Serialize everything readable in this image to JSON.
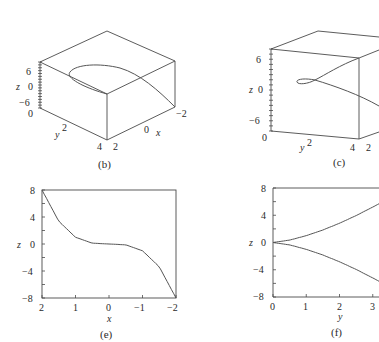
{
  "chart_data": [
    {
      "id": "b",
      "type": "line",
      "projection": "3d",
      "caption": "(b)",
      "title": "",
      "xlabel": "x",
      "ylabel": "y",
      "zlabel": "z",
      "x_ticks": [
        "2",
        "0",
        "−2"
      ],
      "y_ticks": [
        "0",
        "2",
        "4"
      ],
      "z_ticks": [
        "6",
        "0",
        "−6"
      ],
      "xlim": [
        2,
        -2
      ],
      "ylim": [
        0,
        4
      ],
      "zlim": [
        -8,
        8
      ],
      "series": [
        {
          "name": "space curve",
          "description": "curve x=t, y=t^2, z=t^3 viewed from above, appearing as a loop"
        }
      ]
    },
    {
      "id": "c",
      "type": "line",
      "projection": "3d",
      "caption": "(c)",
      "title": "",
      "xlabel": "x",
      "ylabel": "y",
      "zlabel": "z",
      "x_ticks": [
        "2"
      ],
      "y_ticks": [
        "0",
        "2",
        "4"
      ],
      "z_ticks": [
        "6",
        "0",
        "−6"
      ],
      "ylim": [
        0,
        4
      ],
      "zlim": [
        -8,
        8
      ],
      "series": [
        {
          "name": "space curve",
          "description": "same curve from side view, small loop"
        }
      ]
    },
    {
      "id": "e",
      "type": "line",
      "caption": "(e)",
      "title": "",
      "xlabel": "x",
      "ylabel": "z",
      "x_ticks": [
        "2",
        "1",
        "0",
        "−1",
        "−2"
      ],
      "y_ticks": [
        "8",
        "4",
        "0",
        "−4",
        "−8"
      ],
      "xlim": [
        2,
        -2
      ],
      "ylim": [
        -8,
        8
      ],
      "grid": false,
      "series": [
        {
          "name": "z = x^3",
          "x": [
            2,
            1.5,
            1,
            0.5,
            0,
            -0.5,
            -1,
            -1.5,
            -2
          ],
          "y": [
            8,
            3.375,
            1,
            0.125,
            0,
            -0.125,
            -1,
            -3.375,
            -8
          ]
        }
      ]
    },
    {
      "id": "f",
      "type": "line",
      "caption": "(f)",
      "title": "",
      "xlabel": "y",
      "ylabel": "z",
      "x_ticks": [
        "0",
        "1",
        "2",
        "3"
      ],
      "y_ticks": [
        "8",
        "4",
        "0",
        "−4",
        "−8"
      ],
      "xlim": [
        0,
        4
      ],
      "ylim": [
        -8,
        8
      ],
      "grid": false,
      "series": [
        {
          "name": "z = +y^1.5",
          "x": [
            0,
            0.5,
            1,
            1.5,
            2,
            2.5,
            3,
            3.2
          ],
          "y": [
            0,
            0.354,
            1,
            1.837,
            2.828,
            3.953,
            5.196,
            5.724
          ]
        },
        {
          "name": "z = -y^1.5",
          "x": [
            0,
            0.5,
            1,
            1.5,
            2,
            2.5,
            3,
            3.2
          ],
          "y": [
            0,
            -0.354,
            -1,
            -1.837,
            -2.828,
            -3.953,
            -5.196,
            -5.724
          ]
        }
      ]
    }
  ]
}
